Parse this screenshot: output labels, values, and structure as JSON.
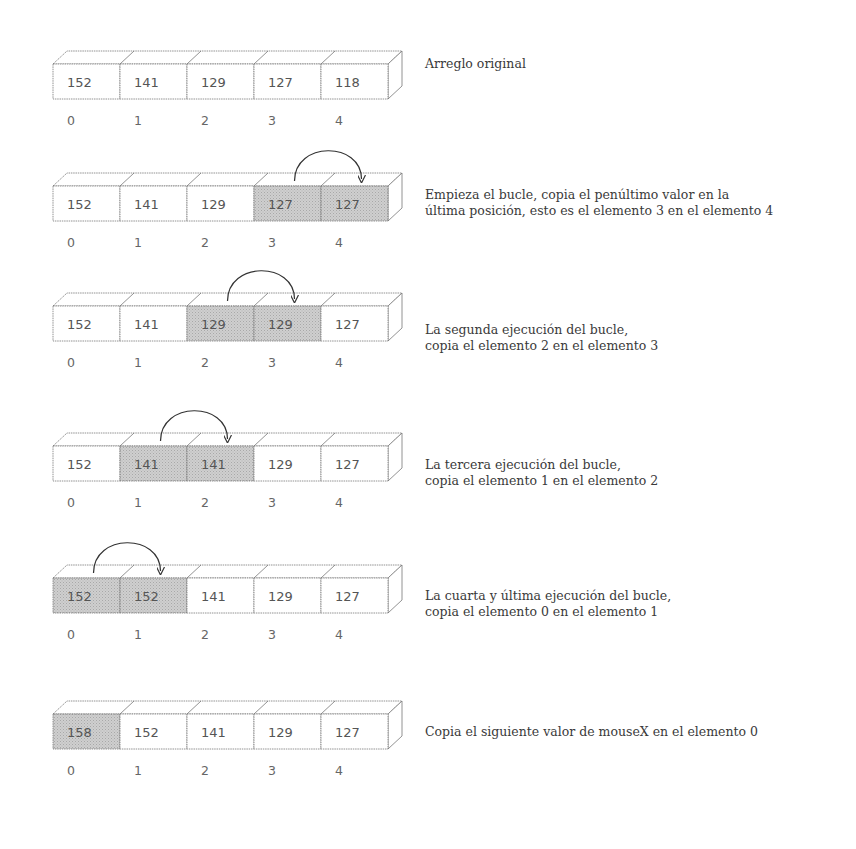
{
  "diagram": {
    "indices": [
      "0",
      "1",
      "2",
      "3",
      "4"
    ],
    "colors": {
      "highlight": "#c4c4c4",
      "cell": "#ffffff",
      "stroke": "#777777",
      "arrow": "#333333",
      "text": "#3a3a3a"
    },
    "steps": [
      {
        "values": [
          "152",
          "141",
          "129",
          "127",
          "118"
        ],
        "highlighted": [],
        "arrow": null,
        "caption": "Arreglo original"
      },
      {
        "values": [
          "152",
          "141",
          "129",
          "127",
          "127"
        ],
        "highlighted": [
          3,
          4
        ],
        "arrow": {
          "from": 3,
          "to": 4
        },
        "caption": "Empieza el bucle, copia el penúltimo valor en la\núltima posición, esto es el elemento 3 en el elemento 4"
      },
      {
        "values": [
          "152",
          "141",
          "129",
          "129",
          "127"
        ],
        "highlighted": [
          2,
          3
        ],
        "arrow": {
          "from": 2,
          "to": 3
        },
        "caption": "La segunda ejecución del bucle,\ncopia el elemento 2 en el elemento 3"
      },
      {
        "values": [
          "152",
          "141",
          "141",
          "129",
          "127"
        ],
        "highlighted": [
          1,
          2
        ],
        "arrow": {
          "from": 1,
          "to": 2
        },
        "caption": "La tercera ejecución del bucle,\ncopia el elemento 1 en el elemento 2"
      },
      {
        "values": [
          "152",
          "152",
          "141",
          "129",
          "127"
        ],
        "highlighted": [
          0,
          1
        ],
        "arrow": {
          "from": 0,
          "to": 1
        },
        "caption": "La cuarta y última ejecución del bucle,\ncopia el elemento 0 en el elemento 1"
      },
      {
        "values": [
          "158",
          "152",
          "141",
          "129",
          "127"
        ],
        "highlighted": [
          0
        ],
        "arrow": null,
        "caption": "Copia el siguiente valor de mouseX en el elemento 0"
      }
    ]
  }
}
